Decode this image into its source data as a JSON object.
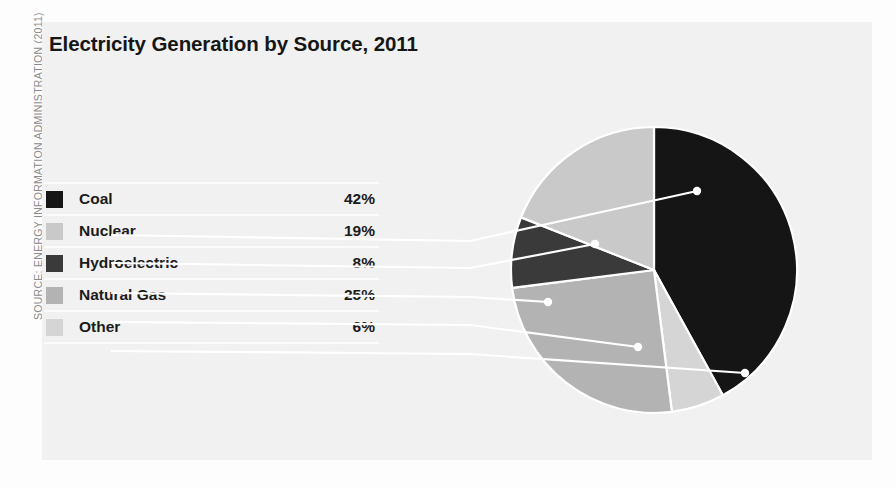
{
  "figure": {
    "title": "Electricity Generation by Source, 2011",
    "source_credit": "SOURCE: ENERGY INFORMATION ADMINISTRATION (2011)"
  },
  "legend": {
    "rows": [
      {
        "label": "Coal",
        "value": "42%",
        "color": "#151515"
      },
      {
        "label": "Nuclear",
        "value": "19%",
        "color": "#c9c9c9"
      },
      {
        "label": "Hydroelectric",
        "value": "8%",
        "color": "#3a3a3a"
      },
      {
        "label": "Natural Gas",
        "value": "25%",
        "color": "#b3b3b3"
      },
      {
        "label": "Other",
        "value": "6%",
        "color": "#d5d5d5"
      }
    ]
  },
  "chart_data": {
    "type": "pie",
    "title": "Electricity Generation by Source, 2011",
    "subtitle": "",
    "xlabel": "",
    "ylabel": "",
    "unit": "percent",
    "legend_position": "left",
    "grid": false,
    "start_angle_deg": 0,
    "direction": "clockwise",
    "categories": [
      "Coal",
      "Nuclear",
      "Hydroelectric",
      "Natural Gas",
      "Other"
    ],
    "values": [
      42,
      19,
      8,
      25,
      6
    ],
    "labels": [
      "42%",
      "19%",
      "8%",
      "25%",
      "6%"
    ],
    "colors": [
      "#151515",
      "#c9c9c9",
      "#3a3a3a",
      "#b3b3b3",
      "#d5d5d5"
    ],
    "slice_order_clockwise_from_top": [
      "Coal",
      "Other",
      "Natural Gas",
      "Hydroelectric",
      "Nuclear"
    ],
    "total": 100,
    "annotations": [
      "SOURCE: ENERGY INFORMATION ADMINISTRATION (2011)"
    ]
  },
  "geometry": {
    "center_x": 654,
    "center_y": 270,
    "radius": 143,
    "leaders": [
      {
        "name": "Coal",
        "dot_x": 697,
        "dot_y": 191,
        "elbow_x": 470,
        "elbow_y": 241,
        "end_x": 112,
        "end_y": 235
      },
      {
        "name": "Nuclear",
        "dot_x": 595,
        "dot_y": 244,
        "elbow_x": 470,
        "elbow_y": 268,
        "end_x": 112,
        "end_y": 263
      },
      {
        "name": "Hydroelectric",
        "dot_x": 548,
        "dot_y": 302,
        "elbow_x": 470,
        "elbow_y": 297,
        "end_x": 112,
        "end_y": 293
      },
      {
        "name": "Natural Gas",
        "dot_x": 638,
        "dot_y": 347,
        "elbow_x": 470,
        "elbow_y": 325,
        "end_x": 112,
        "end_y": 322
      },
      {
        "name": "Other",
        "dot_x": 745,
        "dot_y": 373,
        "elbow_x": 470,
        "elbow_y": 354,
        "end_x": 112,
        "end_y": 351
      }
    ]
  },
  "colors": {
    "page_background": "#fdfdfd",
    "panel_background": "#f1f1f1",
    "title_color": "#161616",
    "text_color": "#1b1b1b",
    "credit_color": "#8b8b8b",
    "leader_color": "#ffffff",
    "separator_color": "#fbfbfb"
  },
  "icons": {
    "swatch": "color-swatch-icon",
    "leader_dot": "leader-dot-icon"
  }
}
